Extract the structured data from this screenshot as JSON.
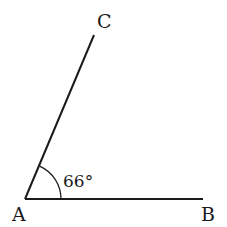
{
  "diagram": {
    "type": "angle",
    "points": {
      "A": {
        "label": "A",
        "x": 25,
        "y": 199
      },
      "B": {
        "label": "B",
        "x": 203,
        "y": 199
      },
      "C": {
        "label": "C",
        "x": 94,
        "y": 35
      }
    },
    "angle": {
      "vertex": "A",
      "label": "66°",
      "degrees": 66
    },
    "colors": {
      "line": "#1a1a1a",
      "background": "#ffffff"
    }
  }
}
